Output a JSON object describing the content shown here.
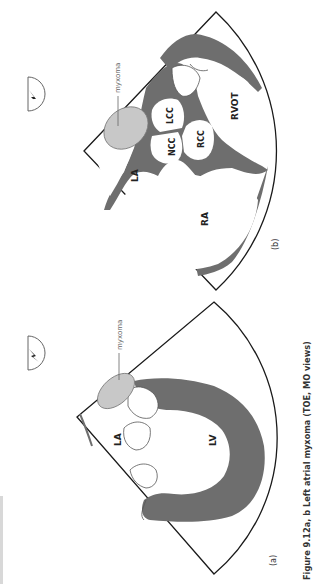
{
  "figure": {
    "caption": "Figure 9.12a, b  Left atrial myxoma (TOE, MO views)",
    "orientation": "rotated-90-ccw",
    "colors": {
      "myocardium": "#6e6e6e",
      "myxoma_fill": "#c8c8c8",
      "outline": "#1a1a1a",
      "background": "#ffffff"
    },
    "panels": [
      {
        "id": "a",
        "panel_label": "(a)",
        "labels": {
          "la": "LA",
          "lv": "LV",
          "myxoma": "myxoma"
        }
      },
      {
        "id": "b",
        "panel_label": "(b)",
        "labels": {
          "la": "LA",
          "ra": "RA",
          "rvot": "RVOT",
          "ncc": "NCC",
          "lcc": "LCC",
          "rcc": "RCC",
          "myxoma": "myxoma"
        }
      }
    ]
  }
}
